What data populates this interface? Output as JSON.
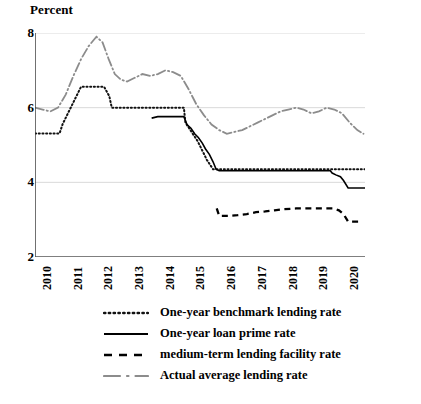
{
  "axis_label": "Percent",
  "yticks": [
    8,
    6,
    4,
    2
  ],
  "xticks": [
    "2010",
    "2011",
    "2012",
    "2013",
    "2014",
    "2015",
    "2016",
    "2017",
    "2018",
    "2019",
    "2020"
  ],
  "colors": {
    "benchmark": "#111111",
    "lpr": "#000000",
    "mlf": "#000000",
    "actual": "#8c8c8c",
    "grid": "#d9d9d9",
    "axis": "#333333"
  },
  "legend": [
    {
      "key": "benchmark",
      "label": "One-year benchmark lending rate",
      "style": "dotted"
    },
    {
      "key": "lpr",
      "label": "One-year loan prime rate",
      "style": "solid"
    },
    {
      "key": "mlf",
      "label": "medium-term lending facility rate",
      "style": "dashed"
    },
    {
      "key": "actual",
      "label": "Actual average lending rate",
      "style": "dashdot"
    }
  ],
  "chart_data": {
    "type": "line",
    "title": "",
    "xlabel": "",
    "ylabel": "Percent",
    "ylim": [
      2,
      8
    ],
    "xlim": [
      2010,
      2020.75
    ],
    "grid": true,
    "legend_position": "below",
    "series": [
      {
        "name": "One-year benchmark lending rate",
        "style": "dotted",
        "color": "#111111",
        "points": [
          [
            2010.0,
            5.31
          ],
          [
            2010.2,
            5.31
          ],
          [
            2010.4,
            5.31
          ],
          [
            2010.6,
            5.31
          ],
          [
            2010.8,
            5.31
          ],
          [
            2010.9,
            5.56
          ],
          [
            2011.05,
            5.81
          ],
          [
            2011.2,
            6.06
          ],
          [
            2011.35,
            6.31
          ],
          [
            2011.5,
            6.56
          ],
          [
            2011.8,
            6.56
          ],
          [
            2012.0,
            6.56
          ],
          [
            2012.25,
            6.56
          ],
          [
            2012.42,
            6.31
          ],
          [
            2012.5,
            6.0
          ],
          [
            2012.75,
            6.0
          ],
          [
            2013.0,
            6.0
          ],
          [
            2013.5,
            6.0
          ],
          [
            2014.0,
            6.0
          ],
          [
            2014.4,
            6.0
          ],
          [
            2014.85,
            6.0
          ],
          [
            2014.9,
            5.6
          ],
          [
            2015.1,
            5.35
          ],
          [
            2015.3,
            5.1
          ],
          [
            2015.45,
            4.85
          ],
          [
            2015.6,
            4.6
          ],
          [
            2015.8,
            4.35
          ],
          [
            2016.0,
            4.35
          ],
          [
            2017.0,
            4.35
          ],
          [
            2018.0,
            4.35
          ],
          [
            2019.0,
            4.35
          ],
          [
            2019.6,
            4.35
          ],
          [
            2020.0,
            4.35
          ],
          [
            2020.75,
            4.35
          ]
        ]
      },
      {
        "name": "One-year loan prime rate",
        "style": "solid",
        "color": "#000000",
        "points": [
          [
            2013.8,
            5.72
          ],
          [
            2014.0,
            5.76
          ],
          [
            2014.3,
            5.76
          ],
          [
            2014.6,
            5.76
          ],
          [
            2014.85,
            5.76
          ],
          [
            2014.95,
            5.55
          ],
          [
            2015.08,
            5.45
          ],
          [
            2015.2,
            5.3
          ],
          [
            2015.32,
            5.2
          ],
          [
            2015.45,
            5.05
          ],
          [
            2015.55,
            4.9
          ],
          [
            2015.68,
            4.75
          ],
          [
            2015.8,
            4.55
          ],
          [
            2015.9,
            4.35
          ],
          [
            2016.0,
            4.31
          ],
          [
            2017.0,
            4.31
          ],
          [
            2018.0,
            4.31
          ],
          [
            2019.0,
            4.31
          ],
          [
            2019.62,
            4.31
          ],
          [
            2019.68,
            4.25
          ],
          [
            2019.8,
            4.2
          ],
          [
            2019.95,
            4.15
          ],
          [
            2020.05,
            4.05
          ],
          [
            2020.2,
            3.85
          ],
          [
            2020.35,
            3.85
          ],
          [
            2020.75,
            3.85
          ]
        ]
      },
      {
        "name": "medium-term lending facility rate",
        "style": "dashed",
        "color": "#000000",
        "points": [
          [
            2015.92,
            3.3
          ],
          [
            2016.0,
            3.1
          ],
          [
            2016.3,
            3.1
          ],
          [
            2016.6,
            3.12
          ],
          [
            2016.9,
            3.15
          ],
          [
            2017.2,
            3.2
          ],
          [
            2017.5,
            3.22
          ],
          [
            2017.8,
            3.25
          ],
          [
            2018.1,
            3.28
          ],
          [
            2018.5,
            3.3
          ],
          [
            2019.0,
            3.3
          ],
          [
            2019.4,
            3.3
          ],
          [
            2019.7,
            3.3
          ],
          [
            2019.9,
            3.25
          ],
          [
            2020.05,
            3.15
          ],
          [
            2020.2,
            2.95
          ],
          [
            2020.4,
            2.95
          ],
          [
            2020.6,
            2.95
          ]
        ]
      },
      {
        "name": "Actual average lending rate",
        "style": "dashdot",
        "color": "#8c8c8c",
        "points": [
          [
            2010.0,
            6.0
          ],
          [
            2010.25,
            5.95
          ],
          [
            2010.5,
            5.9
          ],
          [
            2010.75,
            6.0
          ],
          [
            2011.0,
            6.35
          ],
          [
            2011.25,
            6.85
          ],
          [
            2011.5,
            7.3
          ],
          [
            2011.75,
            7.65
          ],
          [
            2012.0,
            7.9
          ],
          [
            2012.2,
            7.75
          ],
          [
            2012.4,
            7.3
          ],
          [
            2012.6,
            6.9
          ],
          [
            2012.8,
            6.75
          ],
          [
            2013.0,
            6.7
          ],
          [
            2013.25,
            6.8
          ],
          [
            2013.5,
            6.9
          ],
          [
            2013.75,
            6.85
          ],
          [
            2014.0,
            6.9
          ],
          [
            2014.25,
            7.0
          ],
          [
            2014.5,
            6.95
          ],
          [
            2014.75,
            6.85
          ],
          [
            2015.0,
            6.5
          ],
          [
            2015.25,
            6.1
          ],
          [
            2015.5,
            5.8
          ],
          [
            2015.75,
            5.55
          ],
          [
            2016.0,
            5.4
          ],
          [
            2016.25,
            5.3
          ],
          [
            2016.5,
            5.35
          ],
          [
            2016.75,
            5.4
          ],
          [
            2017.0,
            5.5
          ],
          [
            2017.25,
            5.6
          ],
          [
            2017.5,
            5.7
          ],
          [
            2017.75,
            5.8
          ],
          [
            2018.0,
            5.9
          ],
          [
            2018.25,
            5.95
          ],
          [
            2018.5,
            6.0
          ],
          [
            2018.75,
            5.95
          ],
          [
            2019.0,
            5.85
          ],
          [
            2019.25,
            5.9
          ],
          [
            2019.5,
            6.0
          ],
          [
            2019.75,
            5.95
          ],
          [
            2020.0,
            5.85
          ],
          [
            2020.25,
            5.6
          ],
          [
            2020.5,
            5.4
          ],
          [
            2020.7,
            5.3
          ]
        ]
      }
    ]
  }
}
